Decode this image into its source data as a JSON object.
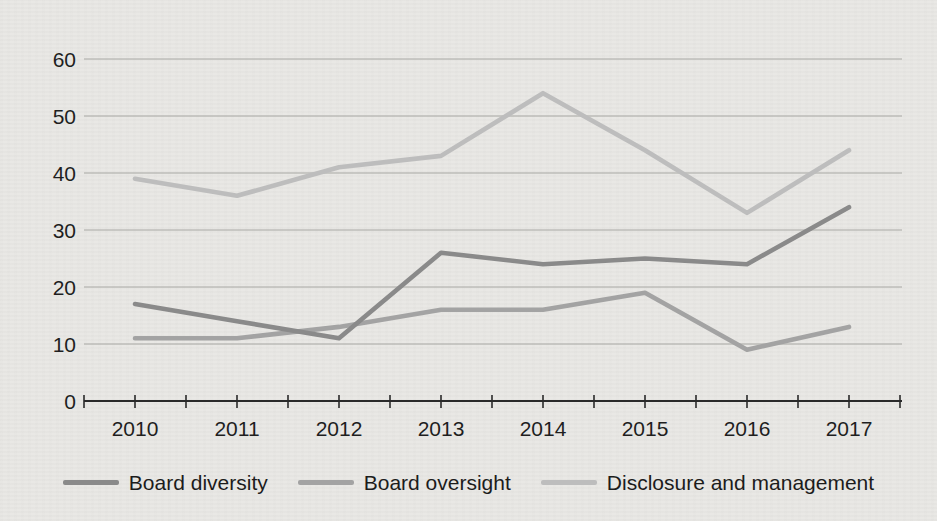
{
  "chart_data": {
    "type": "line",
    "title": "",
    "xlabel": "",
    "ylabel": "",
    "categories": [
      "2010",
      "2011",
      "2012",
      "2013",
      "2014",
      "2015",
      "2016",
      "2017"
    ],
    "series": [
      {
        "name": "Board diversity",
        "color": "#8a8a8a",
        "values": [
          17,
          14,
          11,
          26,
          24,
          25,
          24,
          34
        ]
      },
      {
        "name": "Board oversight",
        "color": "#a3a3a3",
        "values": [
          11,
          11,
          13,
          16,
          16,
          19,
          9,
          13
        ]
      },
      {
        "name": "Disclosure and management",
        "color": "#bdbdbd",
        "values": [
          39,
          36,
          41,
          43,
          54,
          44,
          33,
          44
        ]
      }
    ],
    "ylim": [
      0,
      60
    ],
    "yticks": [
      0,
      10,
      20,
      30,
      40,
      50,
      60
    ],
    "grid": true,
    "legend_position": "bottom"
  },
  "colors": {
    "background": "#e9e8e5",
    "gridline": "#a8a8a4",
    "axis": "#2a2a2a",
    "tick": "#2a2a2a",
    "text": "#1f1f1f"
  }
}
